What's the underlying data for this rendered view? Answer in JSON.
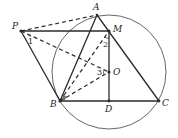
{
  "diagram": {
    "type": "geometry",
    "points": {
      "A": {
        "label": "A",
        "x": 97,
        "y": 15
      },
      "M": {
        "label": "M",
        "x": 109,
        "y": 31
      },
      "P": {
        "label": "P",
        "x": 21,
        "y": 31
      },
      "O": {
        "label": "O",
        "x": 109,
        "y": 72
      },
      "B": {
        "label": "B",
        "x": 60,
        "y": 101
      },
      "D": {
        "label": "D",
        "x": 109,
        "y": 101
      },
      "C": {
        "label": "C",
        "x": 159,
        "y": 101
      }
    },
    "circle": {
      "center": "O",
      "cx": 109,
      "cy": 72,
      "r": 57
    },
    "solid_segments": [
      "PM",
      "PB",
      "AB",
      "AC",
      "BC",
      "MD"
    ],
    "dashed_segments": [
      "PA",
      "PO",
      "BM",
      "BO"
    ],
    "angle_labels": {
      "angle1": "1",
      "angle2": "2",
      "angle3": "3"
    }
  }
}
